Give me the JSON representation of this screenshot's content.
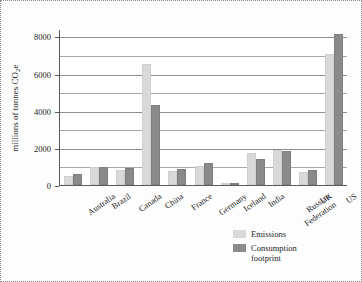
{
  "chart_data": {
    "type": "bar",
    "title": "",
    "xlabel": "",
    "ylabel": "millions of tonnes CO2e",
    "ylabel_prefix": "millions of tonnes CO",
    "ylabel_sub": "2",
    "ylabel_suffix": "e",
    "ylim": [
      0,
      8400
    ],
    "yticks": [
      0,
      2000,
      4000,
      6000,
      8000
    ],
    "ytick_labels": [
      "0",
      "2000",
      "4000",
      "6000",
      "8000"
    ],
    "minor_gridlines": [
      1000,
      3000,
      5000,
      7000
    ],
    "grid": true,
    "legend_position": "bottom-right",
    "categories": [
      "Australia",
      "Brazil",
      "Canada",
      "China",
      "France",
      "Germany",
      "Iceland",
      "India",
      "Russian\nFederation",
      "UK",
      "US"
    ],
    "series": [
      {
        "name": "Emissions",
        "color": "#d9d9d9",
        "values": [
          480,
          990,
          830,
          6500,
          760,
          1000,
          5,
          1750,
          1870,
          700,
          7050
        ]
      },
      {
        "name": "Consumption footprint",
        "color": "#8a8a8a",
        "values": [
          570,
          960,
          890,
          4300,
          860,
          1200,
          5,
          1400,
          1810,
          820,
          8120
        ]
      }
    ]
  },
  "legend": {
    "items": [
      {
        "label": "Emissions"
      },
      {
        "label": "Consumption\nfootprint"
      }
    ]
  }
}
